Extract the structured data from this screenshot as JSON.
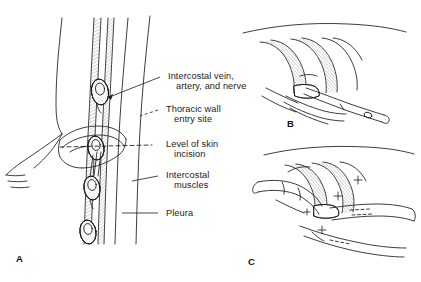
{
  "figure": {
    "type": "medical-illustration",
    "background_color": "#ffffff",
    "ink_color": "#1a1a1a",
    "shade_color": "#9a9a9a"
  },
  "panels": [
    {
      "id": "A",
      "letter": "A",
      "caption": "Lateral chest wall anatomy with rib spaces and neurovascular bundles"
    },
    {
      "id": "B",
      "letter": "B",
      "caption": "Clamp advanced over superior rib margin into pleural space"
    },
    {
      "id": "C",
      "letter": "C",
      "caption": "Finger guides chest tube through the tract into the pleural space"
    }
  ],
  "labels": [
    {
      "id": "intercostal-bundle",
      "line1": "Intercostal vein,",
      "line2": "artery, and nerve",
      "leader": "arrow"
    },
    {
      "id": "thoracic-wall-entry",
      "line1": "Thoracic wall",
      "line2": "entry site",
      "leader": "dashed"
    },
    {
      "id": "skin-incision-level",
      "line1": "Level of skin",
      "line2": "incision",
      "leader": "dashed"
    },
    {
      "id": "intercostal-muscles",
      "line1": "Intercostal",
      "line2": "muscles",
      "leader": "solid"
    },
    {
      "id": "pleura",
      "line1": "Pleura",
      "line2": "",
      "leader": "solid"
    }
  ]
}
